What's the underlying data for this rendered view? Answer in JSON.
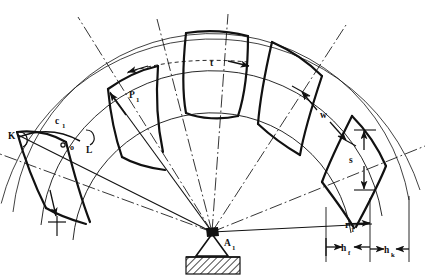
{
  "figure": {
    "type": "engineering-line-drawing",
    "background_color": "#ffffff",
    "line_color": "#111111",
    "width": 427,
    "height": 277
  },
  "labels": {
    "pitch_point": {
      "base": "P",
      "sub": "1"
    },
    "point_k": {
      "base": "K",
      "sub": ""
    },
    "point_l": {
      "base": "L",
      "sub": ""
    },
    "chord_c1": {
      "base": "c",
      "sub": "1"
    },
    "pitch_t": {
      "base": "t",
      "sub": ""
    },
    "width_w": {
      "base": "w",
      "sub": ""
    },
    "thickness_s": {
      "base": "s",
      "sub": ""
    },
    "radius_r1": {
      "base": "r",
      "sub": "1"
    },
    "dedendum_hf": {
      "base": "h",
      "sub": "f"
    },
    "addendum_hk": {
      "base": "h",
      "sub": "k"
    },
    "center_a1": {
      "base": "A",
      "sub": "1"
    },
    "origin_marker": {
      "base": "o",
      "sub": ""
    }
  },
  "geometry": {
    "center": {
      "x": 212,
      "y": 232
    },
    "arcs": [
      {
        "name": "outer-tip-circle",
        "radius": 218,
        "style": "thin"
      },
      {
        "name": "addendum-circle",
        "radius": 200,
        "style": "thin"
      },
      {
        "name": "pitch-circle",
        "radius": 172,
        "style": "thin"
      },
      {
        "name": "root-circle",
        "radius": 140,
        "style": "thin"
      }
    ],
    "radial_centerlines": [
      {
        "name": "centerline-left-outer",
        "angle_deg": 186
      },
      {
        "name": "centerline-left",
        "angle_deg": 151
      },
      {
        "name": "centerline-mid-left",
        "angle_deg": 118
      },
      {
        "name": "centerline-mid-right",
        "angle_deg": 86
      },
      {
        "name": "centerline-right",
        "angle_deg": 52
      },
      {
        "name": "centerline-right-outer",
        "angle_deg": 18
      }
    ],
    "teeth_count": 5,
    "support": {
      "name": "pivot-support",
      "triangle_half_width": 16,
      "triangle_height": 22,
      "hatch_width": 54,
      "hatch_height": 17
    }
  }
}
